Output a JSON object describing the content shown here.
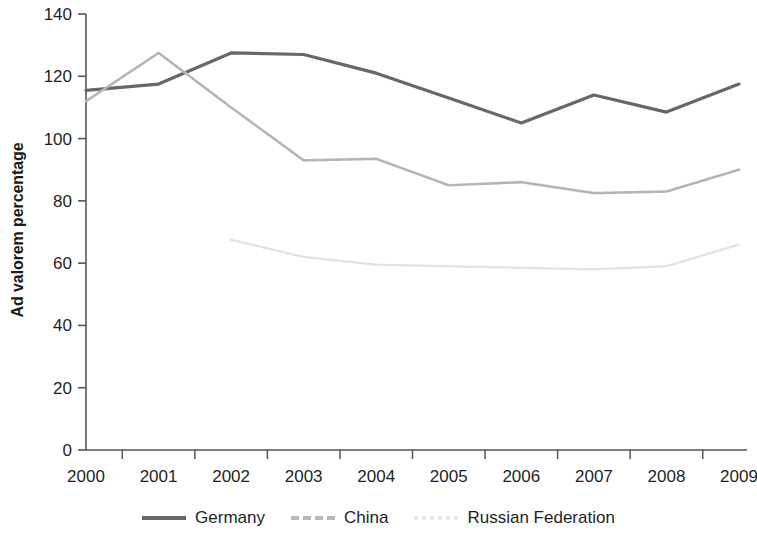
{
  "chart_data": {
    "type": "line",
    "title": "",
    "xlabel": "",
    "ylabel": "Ad valorem percentage",
    "x": [
      "2000",
      "2001",
      "2002",
      "2003",
      "2004",
      "2005",
      "2006",
      "2007",
      "2008",
      "2009"
    ],
    "xlim": [
      2000,
      2009
    ],
    "ylim": [
      0,
      140
    ],
    "yticks": [
      0,
      20,
      40,
      60,
      80,
      100,
      120,
      140
    ],
    "grid": false,
    "legend_position": "bottom",
    "series": [
      {
        "name": "Germany",
        "color": "#676767",
        "style": "solid",
        "width": 3.2,
        "values": [
          115.5,
          117.5,
          127.5,
          127,
          121,
          113,
          105,
          114,
          108.5,
          117.5
        ]
      },
      {
        "name": "China",
        "color": "#b5b5b5",
        "style": "dashed",
        "width": 2.6,
        "values": [
          112,
          127.5,
          110,
          93,
          93.5,
          85,
          86,
          82.5,
          83,
          90
        ]
      },
      {
        "name": "Russian Federation",
        "color": "#e2e2e2",
        "style": "dotted",
        "width": 2.4,
        "values": [
          null,
          null,
          67.5,
          62,
          59.5,
          59,
          58.5,
          58,
          59,
          66
        ]
      }
    ]
  },
  "axis": {
    "y_tick_labels": [
      "140",
      "120",
      "100",
      "80",
      "60",
      "40",
      "20",
      "0"
    ],
    "x_tick_labels": [
      "2000",
      "2001",
      "2002",
      "2003",
      "2004",
      "2005",
      "2006",
      "2007",
      "2008",
      "2009"
    ],
    "y_axis_title": "Ad valorem percentage",
    "axis_color": "#555555"
  },
  "legend": {
    "items": [
      {
        "label": "Germany",
        "color": "#676767",
        "style": "solid",
        "thickness": 4
      },
      {
        "label": "China",
        "color": "#b9b9b9",
        "style": "dashed",
        "thickness": 4
      },
      {
        "label": "Russian Federation",
        "color": "#e4e4e4",
        "style": "dotted",
        "thickness": 4
      }
    ]
  }
}
